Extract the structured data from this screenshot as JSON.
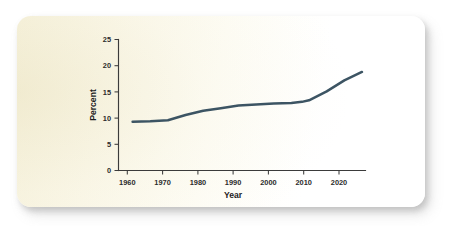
{
  "card": {
    "background_color": "#fbf8ea",
    "page_background_color": "#ffffff"
  },
  "chart_data": {
    "type": "line",
    "title": "",
    "xlabel": "Year",
    "ylabel": "Percent",
    "xlim": [
      1956,
      2026
    ],
    "ylim": [
      0,
      25
    ],
    "xticks": [
      1960,
      1970,
      1980,
      1990,
      2000,
      2010,
      2020
    ],
    "xtick_labels": [
      "1960",
      "1970",
      "1980",
      "1990",
      "2000",
      "2010",
      "2020"
    ],
    "yticks": [
      0,
      5,
      10,
      15,
      20,
      25
    ],
    "ytick_labels": [
      "0",
      "5",
      "10",
      "15",
      "20",
      "25"
    ],
    "grid": false,
    "legend": false,
    "line_color": "#3c5463",
    "series": [
      {
        "name": "Percent",
        "x": [
          1960,
          1965,
          1970,
          1975,
          1980,
          1985,
          1990,
          1995,
          2000,
          2005,
          2008,
          2010,
          2015,
          2020,
          2025
        ],
        "values": [
          9.3,
          9.4,
          9.6,
          10.6,
          11.4,
          11.9,
          12.4,
          12.6,
          12.8,
          12.9,
          13.1,
          13.4,
          15.1,
          17.2,
          18.8
        ]
      }
    ]
  }
}
